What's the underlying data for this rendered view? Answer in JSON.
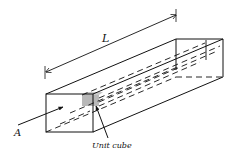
{
  "diagram": {
    "labels": {
      "length": "L",
      "area": "A",
      "unit_cube": "Unit cube"
    },
    "colors": {
      "stroke": "#111111",
      "unit_cube_fill": "#b8b8b8",
      "background": "#ffffff"
    }
  }
}
